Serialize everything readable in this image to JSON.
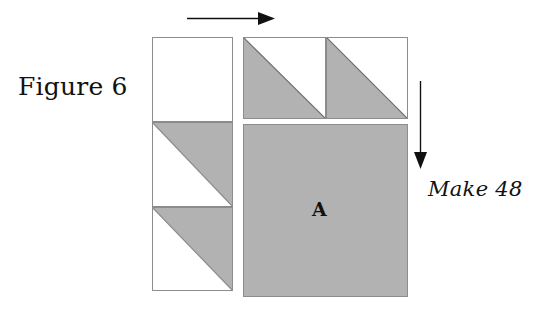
{
  "figure": {
    "caption": "Figure 6",
    "make_label": "Make 48",
    "center_square_label": "A"
  },
  "colors": {
    "fabric_gray": "#b2b2b2",
    "fabric_white": "#ffffff",
    "outline": "#8c8c8c",
    "arrow": "#111111",
    "text": "#111111"
  },
  "arrows": {
    "horizontal": {
      "name": "press-direction-arrow-horizontal",
      "direction": "right"
    },
    "vertical": {
      "name": "press-direction-arrow-vertical",
      "direction": "down"
    }
  },
  "left_column": {
    "name": "left-strip",
    "patches": [
      {
        "label": "",
        "type": "plain",
        "fill": "white"
      },
      {
        "label": "",
        "type": "half-square-triangle",
        "gray_corner": "upper-right"
      },
      {
        "label": "",
        "type": "half-square-triangle",
        "gray_corner": "upper-right"
      }
    ]
  },
  "top_row": {
    "name": "top-strip",
    "patches": [
      {
        "label": "",
        "type": "half-square-triangle",
        "gray_corner": "lower-left"
      },
      {
        "label": "",
        "type": "half-square-triangle",
        "gray_corner": "lower-left"
      }
    ]
  },
  "center_block": {
    "name": "square-a",
    "label": "A",
    "type": "plain",
    "fill": "gray"
  }
}
